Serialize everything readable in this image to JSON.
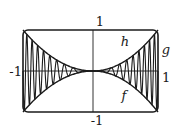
{
  "figure": {
    "background": "#ffffff",
    "ink_color": "#1b1b1b"
  },
  "labels": {
    "tick_top": "1",
    "tick_bottom": "-1",
    "tick_left": "-1",
    "tick_right": "1",
    "curve_upper": "h",
    "curve_osc": "g",
    "curve_lower": "f"
  },
  "chart_data": {
    "type": "line",
    "title": "",
    "xlabel": "",
    "ylabel": "",
    "xlim": [
      -1,
      1
    ],
    "ylim": [
      -1,
      1
    ],
    "frame": true,
    "axes_through_origin": true,
    "grid": false,
    "x_ticks": [
      {
        "value": -1,
        "label": "-1"
      },
      {
        "value": 1,
        "label": "1"
      }
    ],
    "y_ticks": [
      {
        "value": -1,
        "label": "-1"
      },
      {
        "value": 1,
        "label": "1"
      }
    ],
    "series": [
      {
        "name": "h",
        "role": "upper-envelope",
        "shape": "y = x^2",
        "points": [
          [
            -1,
            1
          ],
          [
            -0.75,
            0.5625
          ],
          [
            -0.5,
            0.25
          ],
          [
            -0.25,
            0.0625
          ],
          [
            0,
            0
          ],
          [
            0.25,
            0.0625
          ],
          [
            0.5,
            0.25
          ],
          [
            0.75,
            0.5625
          ],
          [
            1,
            1
          ]
        ]
      },
      {
        "name": "g",
        "role": "oscillating-curve",
        "envelope": "between f and h, amplitude x^2",
        "half_cycles_per_side": 18,
        "chirp_exponent": 1.55,
        "note": "oscillates faster toward x = -1 and x = 1, pinched to 0 at origin"
      },
      {
        "name": "f",
        "role": "lower-envelope",
        "shape": "y = -x^2",
        "points": [
          [
            -1,
            -1
          ],
          [
            -0.75,
            -0.5625
          ],
          [
            -0.5,
            -0.25
          ],
          [
            -0.25,
            -0.0625
          ],
          [
            0,
            0
          ],
          [
            0.25,
            -0.0625
          ],
          [
            0.5,
            -0.25
          ],
          [
            0.75,
            -0.5625
          ],
          [
            1,
            -1
          ]
        ]
      }
    ]
  }
}
